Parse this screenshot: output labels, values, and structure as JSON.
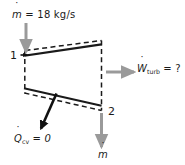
{
  "figure": {
    "name": "turbine-control-volume-diagram",
    "width": 185,
    "height": 165,
    "background_color": "#ffffff"
  },
  "colors": {
    "line": "#1a1a1a",
    "arrow_gray": "#9a9a9a",
    "arrow_black": "#111111",
    "text": "#1a1a1a",
    "dashed_boundary": "#1a1a1a"
  },
  "labels": {
    "inlet_mass_flow": {
      "symbol": "m",
      "dot": "˙",
      "equals": "=",
      "value": "18",
      "units": "kg/s",
      "full_text": "ṁ = 18 kg/s"
    },
    "work_output": {
      "symbol": "W",
      "dot": "˙",
      "subscript": "turb",
      "equals": "=",
      "value": "?",
      "full_text": "Ẇturb = ?"
    },
    "heat_transfer": {
      "symbol": "Q",
      "dot": "˙",
      "subscript": "cv",
      "equals": "=",
      "value": "0",
      "full_text": "Q̇cv = 0"
    },
    "outlet_mass_flow": {
      "symbol": "m",
      "dot": "˙",
      "full_text": "ṁ"
    },
    "state_1": "1",
    "state_2": "2"
  },
  "icons": {
    "inlet_arrow": "arrow-down-gray-icon",
    "outlet_arrow": "arrow-down-gray-icon",
    "work_arrow": "arrow-right-gray-icon",
    "heat_arrow": "arrow-down-left-black-icon"
  }
}
